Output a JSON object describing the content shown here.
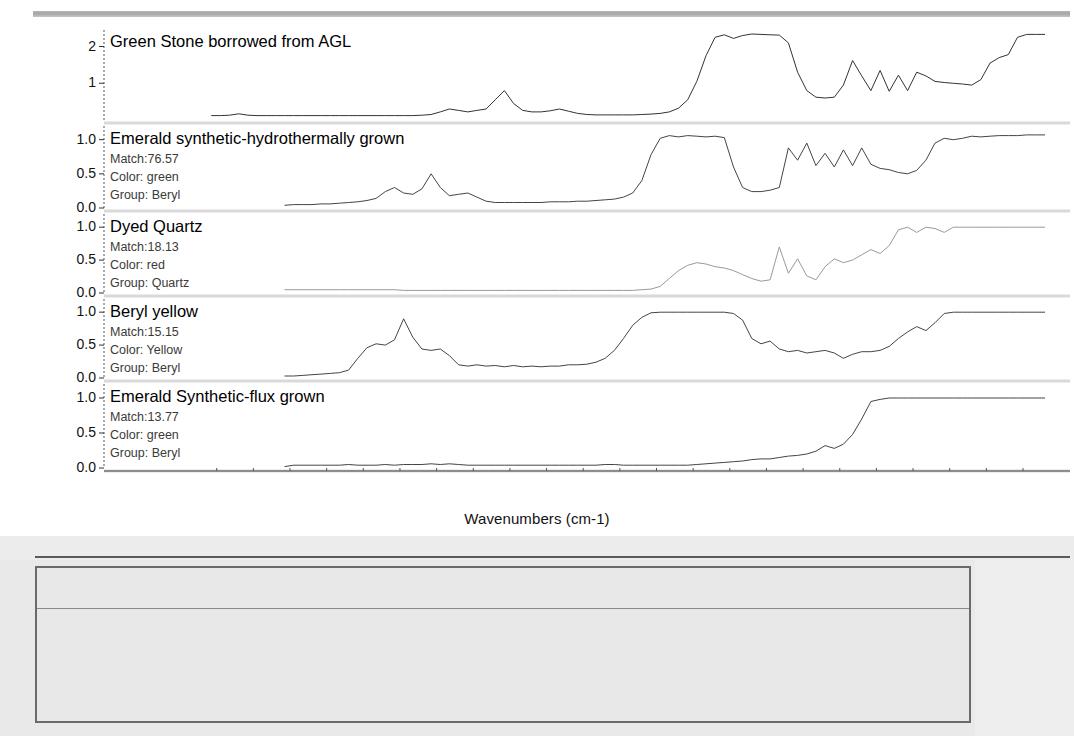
{
  "window": {
    "toolbar_icon": "toolbar-strip"
  },
  "plot": {
    "x_axis_title": "Wavenumbers (cm-1)",
    "x_ticks": [
      {
        "label": "6000",
        "value": 6000
      },
      {
        "label": "5000",
        "value": 5000
      },
      {
        "label": "4000",
        "value": 4000
      },
      {
        "label": "3000",
        "value": 3000
      },
      {
        "label": "2000",
        "value": 2000
      }
    ],
    "y_ticks_top": [
      "2",
      "1"
    ],
    "y_ticks_standard": [
      "1.0",
      "0.5",
      "0.0"
    ],
    "labels": {
      "match_prefix": "Match:",
      "color_prefix": "Color:",
      "group_prefix": "Group:"
    }
  },
  "chart_data": {
    "type": "line",
    "xlabel": "Wavenumbers (cm-1)",
    "ylabel": "Absorbance",
    "xlim": [
      6430,
      1880
    ],
    "x_reversed": true,
    "grid": false,
    "legend": "none",
    "panels": [
      {
        "name": "Green Stone borrowed from AGL",
        "title": "Green Stone borrowed from AGL",
        "is_unknown": true,
        "match": null,
        "color": null,
        "group": null,
        "ylim": [
          0,
          2.45
        ],
        "yticks": [
          2,
          1
        ],
        "trace_color": "#333333",
        "x": [
          6430,
          6380,
          6330,
          6280,
          6230,
          6180,
          6130,
          6080,
          6030,
          5980,
          5930,
          5880,
          5830,
          5780,
          5730,
          5680,
          5630,
          5580,
          5530,
          5480,
          5430,
          5380,
          5330,
          5280,
          5230,
          5180,
          5130,
          5080,
          5030,
          4980,
          4930,
          4880,
          4830,
          4780,
          4730,
          4680,
          4630,
          4580,
          4530,
          4480,
          4430,
          4380,
          4330,
          4280,
          4230,
          4180,
          4130,
          4080,
          4030,
          3980,
          3930,
          3880,
          3830,
          3780,
          3730,
          3680,
          3630,
          3580,
          3530,
          3480,
          3430,
          3380,
          3330,
          3280,
          3230,
          3180,
          3130,
          3080,
          3030,
          2980,
          2930,
          2880,
          2830,
          2780,
          2730,
          2680,
          2630,
          2580,
          2530,
          2480,
          2430,
          2380,
          2330,
          2280,
          2230,
          2180,
          2130,
          2080,
          2030,
          1980,
          1930,
          1880
        ],
        "y": [
          0.12,
          0.12,
          0.13,
          0.17,
          0.13,
          0.12,
          0.12,
          0.12,
          0.12,
          0.12,
          0.12,
          0.12,
          0.12,
          0.12,
          0.12,
          0.12,
          0.12,
          0.12,
          0.12,
          0.12,
          0.12,
          0.12,
          0.12,
          0.13,
          0.15,
          0.22,
          0.3,
          0.26,
          0.22,
          0.26,
          0.3,
          0.55,
          0.8,
          0.45,
          0.26,
          0.22,
          0.22,
          0.25,
          0.3,
          0.24,
          0.18,
          0.15,
          0.14,
          0.14,
          0.14,
          0.14,
          0.14,
          0.15,
          0.16,
          0.18,
          0.22,
          0.32,
          0.55,
          1.05,
          1.75,
          2.25,
          2.32,
          2.22,
          2.3,
          2.34,
          2.33,
          2.32,
          2.31,
          2.1,
          1.3,
          0.8,
          0.62,
          0.6,
          0.62,
          0.95,
          1.62,
          1.2,
          0.8,
          1.35,
          0.78,
          1.22,
          0.8,
          1.3,
          1.2,
          1.05,
          1.02,
          1.0,
          0.98,
          0.95,
          1.1,
          1.55,
          1.7,
          1.78,
          2.25,
          2.33,
          2.33,
          2.33
        ]
      },
      {
        "name": "Emerald synthetic-hydrothermally grown",
        "title": "Emerald synthetic-hydrothermally grown",
        "is_unknown": false,
        "match": "76.57",
        "color": "green",
        "group": "Beryl",
        "ylim": [
          0,
          1.2
        ],
        "yticks": [
          1.0,
          0.5,
          0.0
        ],
        "trace_color": "#444444",
        "x": [
          6030,
          5980,
          5930,
          5880,
          5830,
          5780,
          5730,
          5680,
          5630,
          5580,
          5530,
          5480,
          5430,
          5380,
          5330,
          5280,
          5230,
          5180,
          5130,
          5080,
          5030,
          4980,
          4930,
          4880,
          4830,
          4780,
          4730,
          4680,
          4630,
          4580,
          4530,
          4480,
          4430,
          4380,
          4330,
          4280,
          4230,
          4180,
          4130,
          4080,
          4030,
          3980,
          3930,
          3880,
          3830,
          3780,
          3730,
          3680,
          3630,
          3580,
          3530,
          3480,
          3430,
          3380,
          3330,
          3280,
          3230,
          3180,
          3130,
          3080,
          3030,
          2980,
          2930,
          2880,
          2830,
          2780,
          2730,
          2680,
          2630,
          2580,
          2530,
          2480,
          2430,
          2380,
          2330,
          2280,
          2230,
          2180,
          2130,
          2080,
          2030,
          1980,
          1930,
          1880
        ],
        "y": [
          0.04,
          0.05,
          0.05,
          0.05,
          0.06,
          0.06,
          0.07,
          0.08,
          0.09,
          0.11,
          0.14,
          0.24,
          0.3,
          0.22,
          0.2,
          0.28,
          0.5,
          0.3,
          0.18,
          0.2,
          0.22,
          0.16,
          0.1,
          0.08,
          0.08,
          0.08,
          0.08,
          0.08,
          0.08,
          0.09,
          0.09,
          0.09,
          0.1,
          0.1,
          0.11,
          0.12,
          0.13,
          0.16,
          0.22,
          0.4,
          0.78,
          1.02,
          1.06,
          1.04,
          1.06,
          1.05,
          1.04,
          1.05,
          1.03,
          0.6,
          0.3,
          0.24,
          0.24,
          0.26,
          0.3,
          0.88,
          0.7,
          0.95,
          0.62,
          0.8,
          0.6,
          0.85,
          0.62,
          0.88,
          0.64,
          0.58,
          0.56,
          0.52,
          0.5,
          0.55,
          0.7,
          0.95,
          1.02,
          1.0,
          1.02,
          1.05,
          1.04,
          1.05,
          1.06,
          1.06,
          1.06,
          1.07,
          1.07,
          1.07
        ]
      },
      {
        "name": "Dyed Quartz",
        "title": "Dyed Quartz",
        "is_unknown": false,
        "match": "18.13",
        "color": "red",
        "group": "Quartz",
        "ylim": [
          0,
          1.2
        ],
        "yticks": [
          1.0,
          0.5,
          0.0
        ],
        "trace_color": "#9a9a9a",
        "x": [
          6030,
          5980,
          5930,
          5880,
          5830,
          5780,
          5730,
          5680,
          5630,
          5580,
          5530,
          5480,
          5430,
          5380,
          5330,
          5280,
          5230,
          5180,
          5130,
          5080,
          5030,
          4980,
          4930,
          4880,
          4830,
          4780,
          4730,
          4680,
          4630,
          4580,
          4530,
          4480,
          4430,
          4380,
          4330,
          4280,
          4230,
          4180,
          4130,
          4080,
          4030,
          3980,
          3930,
          3880,
          3830,
          3780,
          3730,
          3680,
          3630,
          3580,
          3530,
          3480,
          3430,
          3380,
          3330,
          3280,
          3230,
          3180,
          3130,
          3080,
          3030,
          2980,
          2930,
          2880,
          2830,
          2780,
          2730,
          2680,
          2630,
          2580,
          2530,
          2480,
          2430,
          2380,
          2330,
          2280,
          2230,
          2180,
          2130,
          2080,
          2030,
          1980,
          1930,
          1880
        ],
        "y": [
          0.05,
          0.05,
          0.05,
          0.05,
          0.05,
          0.05,
          0.05,
          0.05,
          0.05,
          0.05,
          0.05,
          0.05,
          0.05,
          0.04,
          0.04,
          0.04,
          0.04,
          0.04,
          0.04,
          0.04,
          0.04,
          0.04,
          0.04,
          0.04,
          0.04,
          0.04,
          0.04,
          0.04,
          0.04,
          0.04,
          0.04,
          0.04,
          0.04,
          0.04,
          0.04,
          0.04,
          0.04,
          0.04,
          0.04,
          0.05,
          0.06,
          0.1,
          0.22,
          0.34,
          0.42,
          0.46,
          0.44,
          0.4,
          0.38,
          0.34,
          0.28,
          0.22,
          0.18,
          0.2,
          0.7,
          0.3,
          0.52,
          0.26,
          0.2,
          0.4,
          0.52,
          0.46,
          0.5,
          0.58,
          0.66,
          0.6,
          0.72,
          0.96,
          1.0,
          0.92,
          1.0,
          0.98,
          0.92,
          1.0,
          1.0,
          1.0,
          1.0,
          1.0,
          1.0,
          1.0,
          1.0,
          1.0,
          1.0,
          1.0
        ]
      },
      {
        "name": "Beryl yellow",
        "title": "Beryl yellow",
        "is_unknown": false,
        "match": "15.15",
        "color": "Yellow",
        "group": "Beryl",
        "ylim": [
          0,
          1.2
        ],
        "yticks": [
          1.0,
          0.5,
          0.0
        ],
        "trace_color": "#444444",
        "x": [
          6030,
          5980,
          5930,
          5880,
          5830,
          5780,
          5730,
          5680,
          5630,
          5580,
          5530,
          5480,
          5430,
          5380,
          5330,
          5280,
          5230,
          5180,
          5130,
          5080,
          5030,
          4980,
          4930,
          4880,
          4830,
          4780,
          4730,
          4680,
          4630,
          4580,
          4530,
          4480,
          4430,
          4380,
          4330,
          4280,
          4230,
          4180,
          4130,
          4080,
          4030,
          3980,
          3930,
          3880,
          3830,
          3780,
          3730,
          3680,
          3630,
          3580,
          3530,
          3480,
          3430,
          3380,
          3330,
          3280,
          3230,
          3180,
          3130,
          3080,
          3030,
          2980,
          2930,
          2880,
          2830,
          2780,
          2730,
          2680,
          2630,
          2580,
          2530,
          2480,
          2430,
          2380,
          2330,
          2280,
          2230,
          2180,
          2130,
          2080,
          2030,
          1980,
          1930,
          1880
        ],
        "y": [
          0.03,
          0.03,
          0.04,
          0.05,
          0.06,
          0.07,
          0.08,
          0.12,
          0.3,
          0.46,
          0.52,
          0.5,
          0.58,
          0.9,
          0.62,
          0.44,
          0.42,
          0.44,
          0.34,
          0.2,
          0.18,
          0.2,
          0.18,
          0.19,
          0.17,
          0.19,
          0.17,
          0.18,
          0.17,
          0.18,
          0.18,
          0.2,
          0.2,
          0.21,
          0.24,
          0.3,
          0.42,
          0.6,
          0.8,
          0.92,
          0.99,
          1.0,
          1.0,
          1.0,
          1.0,
          1.0,
          1.0,
          1.0,
          1.0,
          0.98,
          0.88,
          0.6,
          0.52,
          0.56,
          0.44,
          0.4,
          0.42,
          0.38,
          0.4,
          0.42,
          0.38,
          0.3,
          0.36,
          0.4,
          0.4,
          0.42,
          0.48,
          0.6,
          0.7,
          0.78,
          0.72,
          0.84,
          0.98,
          1.0,
          1.0,
          1.0,
          1.0,
          1.0,
          1.0,
          1.0,
          1.0,
          1.0,
          1.0,
          1.0
        ]
      },
      {
        "name": "Emerald Synthetic-flux grown",
        "title": "Emerald Synthetic-flux grown",
        "is_unknown": false,
        "match": "13.77",
        "color": "green",
        "group": "Beryl",
        "ylim": [
          0,
          1.2
        ],
        "yticks": [
          1.0,
          0.5,
          0.0
        ],
        "trace_color": "#444444",
        "x": [
          6030,
          5980,
          5930,
          5880,
          5830,
          5780,
          5730,
          5680,
          5630,
          5580,
          5530,
          5480,
          5430,
          5380,
          5330,
          5280,
          5230,
          5180,
          5130,
          5080,
          5030,
          4980,
          4930,
          4880,
          4830,
          4780,
          4730,
          4680,
          4630,
          4580,
          4530,
          4480,
          4430,
          4380,
          4330,
          4280,
          4230,
          4180,
          4130,
          4080,
          4030,
          3980,
          3930,
          3880,
          3830,
          3780,
          3730,
          3680,
          3630,
          3580,
          3530,
          3480,
          3430,
          3380,
          3330,
          3280,
          3230,
          3180,
          3130,
          3080,
          3030,
          2980,
          2930,
          2880,
          2830,
          2780,
          2730,
          2680,
          2630,
          2580,
          2530,
          2480,
          2430,
          2380,
          2330,
          2280,
          2230,
          2180,
          2130,
          2080,
          2030,
          1980,
          1930,
          1880
        ],
        "y": [
          0.02,
          0.04,
          0.04,
          0.04,
          0.04,
          0.04,
          0.04,
          0.05,
          0.04,
          0.04,
          0.04,
          0.05,
          0.04,
          0.05,
          0.05,
          0.05,
          0.06,
          0.05,
          0.06,
          0.05,
          0.04,
          0.04,
          0.04,
          0.04,
          0.04,
          0.04,
          0.04,
          0.04,
          0.04,
          0.04,
          0.04,
          0.04,
          0.04,
          0.04,
          0.04,
          0.05,
          0.05,
          0.04,
          0.04,
          0.04,
          0.04,
          0.04,
          0.04,
          0.04,
          0.04,
          0.05,
          0.06,
          0.07,
          0.08,
          0.09,
          0.1,
          0.12,
          0.13,
          0.13,
          0.15,
          0.17,
          0.18,
          0.2,
          0.24,
          0.32,
          0.28,
          0.34,
          0.48,
          0.7,
          0.95,
          0.98,
          1.0,
          1.0,
          1.0,
          1.0,
          1.0,
          1.0,
          1.0,
          1.0,
          1.0,
          1.0,
          1.0,
          1.0,
          1.0,
          1.0,
          1.0,
          1.0,
          1.0,
          1.0
        ]
      }
    ]
  },
  "results_table": {
    "columns": [
      "Index",
      "Match",
      "Compound Name",
      "Library Name"
    ],
    "rows": [
      {
        "index": "8",
        "match": "76.57",
        "name": "Emerald synthetic-hydrothermally grown",
        "library": "GTL2"
      },
      {
        "index": "38",
        "match": "18.13",
        "name": "Dyed Quartz",
        "library": "GTL2"
      },
      {
        "index": "16",
        "match": "15.15",
        "name": "Beryl yellow",
        "library": "GTL2"
      },
      {
        "index": "7",
        "match": "13.77",
        "name": "Emerald Synthetic-flux grown",
        "library": "GTL2"
      },
      {
        "index": "14",
        "match": "13.02",
        "name": "Scapolite",
        "library": "GTL2"
      }
    ]
  }
}
